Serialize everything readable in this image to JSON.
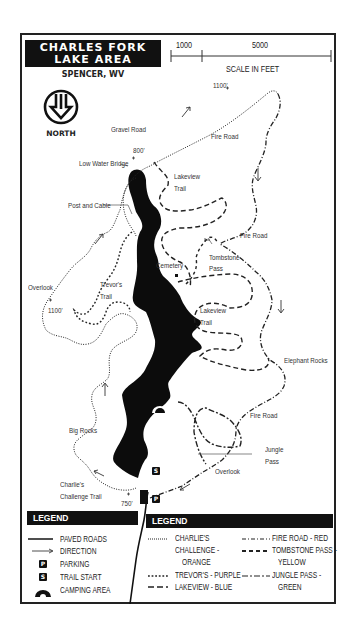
{
  "header": {
    "title_line1": "CHARLES FORK",
    "title_line2": "LAKE AREA",
    "subtitle": "SPENCER, WV",
    "north_label": "NORTH",
    "north_icon": "north-arrow-icon"
  },
  "scale": {
    "tick1": "1000",
    "tick2": "5000",
    "label": "SCALE IN FEET"
  },
  "map_labels": {
    "elev_1100_top": "1100'",
    "gravel_road": "Gravel Road",
    "elev_800": "800'",
    "low_water_bridge": "Low Water Bridge",
    "fire_road_1": "Fire Road",
    "lakeview_trail_1_l1": "Lakeview",
    "lakeview_trail_1_l2": "Trail",
    "post_and_cable": "Post and Cable",
    "fire_road_2": "Fire Road",
    "tombstone_pass_l1": "Tombstone",
    "tombstone_pass_l2": "Pass",
    "cemetery": "Cemetery",
    "trevors_trail_l1": "Trevor's",
    "trevors_trail_l2": "Trail",
    "overlook_1": "Overlook",
    "elev_1100_left": "1100'",
    "lakeview_trail_2_l1": "Lakeview",
    "lakeview_trail_2_l2": "Trail",
    "elephant_rocks": "Elephant Rocks",
    "fire_road_3": "Fire Road",
    "big_rocks": "Big Rocks",
    "jungle_pass_l1": "Jungle",
    "jungle_pass_l2": "Pass",
    "overlook_2": "Overlook",
    "charlies_challenge_l1": "Charlie's",
    "charlies_challenge_l2": "Challenge Trail",
    "elev_750": "750'",
    "trail_start_badge": "S",
    "parking_badge": "P"
  },
  "legend_left": {
    "header": "LEGEND",
    "items": [
      {
        "symbol": "solid-line",
        "label": "PAVED ROADS"
      },
      {
        "symbol": "arrow-icon",
        "label": "DIRECTION"
      },
      {
        "symbol": "parking-icon",
        "label": "PARKING",
        "glyph": "P"
      },
      {
        "symbol": "trail-start-icon",
        "label": "TRAIL START",
        "glyph": "S"
      },
      {
        "symbol": "camping-icon",
        "label": "CAMPING AREA"
      }
    ]
  },
  "legend_right": {
    "header": "LEGEND",
    "items": [
      {
        "symbol": "fine-dotted-line",
        "label_l1": "CHARLIE'S",
        "label_l2": "CHALLENGE -",
        "label_l3": "ORANGE"
      },
      {
        "symbol": "dotted-line",
        "label_l1": "TREVOR'S - PURPLE"
      },
      {
        "symbol": "dashed-line",
        "label_l1": "LAKEVIEW - BLUE"
      },
      {
        "symbol": "dash-dot-line",
        "label_l1": "FIRE ROAD - RED"
      },
      {
        "symbol": "short-dash-line",
        "label_l1": "TOMBSTONE PASS -",
        "label_l2": "YELLOW"
      },
      {
        "symbol": "dash-dash-long-line",
        "label_l1": "JUNGLE PASS -",
        "label_l2": "GREEN"
      }
    ]
  },
  "colors": {
    "ink": "#111111",
    "paper": "#ffffff",
    "text": "#333333"
  }
}
